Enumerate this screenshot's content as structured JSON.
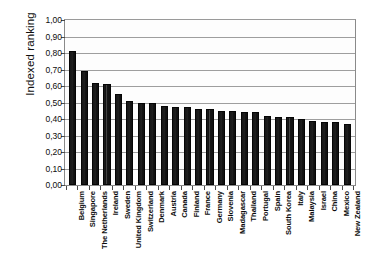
{
  "chart_data": {
    "type": "bar",
    "title": "",
    "xlabel": "",
    "ylabel": "Indexed ranking",
    "ylim": [
      0.0,
      1.0
    ],
    "ytick_labels": [
      "1,00",
      "0,90",
      "0,80",
      "0,70",
      "0,60",
      "0,50",
      "0,40",
      "0,30",
      "0,20",
      "0,10",
      "0,00"
    ],
    "ytick_values": [
      1.0,
      0.9,
      0.8,
      0.7,
      0.6,
      0.5,
      0.4,
      0.3,
      0.2,
      0.1,
      0.0
    ],
    "grid": true,
    "legend": "none",
    "decimal_separator": ",",
    "bar_color": "#141414",
    "categories": [
      "Belgium",
      "Singapore",
      "The Netherlands",
      "Ireland",
      "Sweden",
      "United Kingdom",
      "Switzerland",
      "Denmark",
      "Austria",
      "Canada",
      "Finland",
      "France",
      "Germany",
      "Slovenia",
      "Madagascar",
      "Thailand",
      "Portugal",
      "Spain",
      "South Korea",
      "Italy",
      "Malaysia",
      "Israel",
      "China",
      "Mexico",
      "New Zealand"
    ],
    "values": [
      0.81,
      0.69,
      0.62,
      0.61,
      0.55,
      0.51,
      0.5,
      0.5,
      0.48,
      0.47,
      0.47,
      0.46,
      0.46,
      0.45,
      0.45,
      0.44,
      0.44,
      0.42,
      0.41,
      0.41,
      0.4,
      0.39,
      0.38,
      0.38,
      0.37
    ]
  }
}
